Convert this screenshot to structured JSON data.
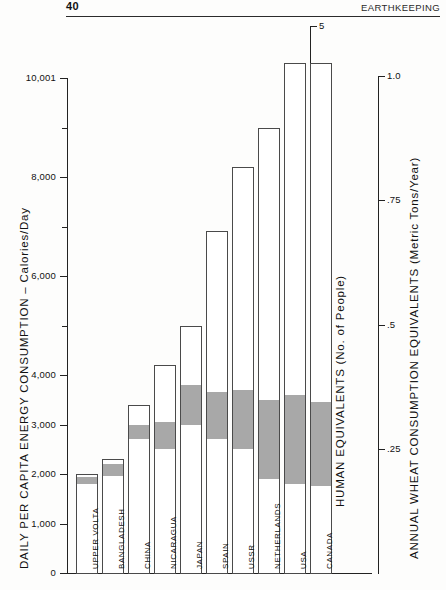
{
  "page": {
    "folio": "40",
    "running_head": "EARTHKEEPING"
  },
  "chart_data": {
    "type": "bar",
    "title": "",
    "categories": [
      "UPPER VOLTA",
      "BANGLADESH",
      "CHINA",
      "NICARAGUA",
      "JAPAN",
      "SPAIN",
      "USSR",
      "NETHERLANDS",
      "USA",
      "CANADA"
    ],
    "values": [
      2000,
      2300,
      3400,
      4200,
      5000,
      6900,
      8200,
      9000,
      10300,
      10300
    ],
    "series": [
      {
        "name": "Daily per capita energy consumption",
        "values": [
          2000,
          2300,
          3400,
          4200,
          5000,
          6900,
          8200,
          9000,
          10300,
          10300
        ]
      },
      {
        "name": "Shaded band (highlighted range)",
        "band_low": [
          1800,
          1950,
          2700,
          2500,
          3000,
          2700,
          2500,
          1900,
          1800,
          1750
        ],
        "band_high": [
          1930,
          2200,
          3000,
          3050,
          3800,
          3650,
          3700,
          3500,
          3600,
          3450
        ]
      }
    ],
    "left_axis": {
      "label": "DAILY PER CAPITA  ENERGY  CONSUMPTION – Calories/Day",
      "ticks": [
        "10,001",
        "8,000",
        "6,000",
        "4,000",
        "3,000",
        "2,000",
        "1,000",
        "0"
      ],
      "tick_values": [
        10001,
        8000,
        6000,
        4000,
        3000,
        2000,
        1000,
        0
      ],
      "minor_ticks": [
        9000,
        7000,
        5000
      ],
      "ylim": [
        0,
        10001
      ]
    },
    "right_axis_inner": {
      "label": "HUMAN  EQUIVALENTS   (No. of People)",
      "ticks": [
        "5",
        "4",
        "3",
        "2",
        "1"
      ],
      "tick_values": [
        5,
        4,
        3,
        2,
        1
      ],
      "ylim": [
        0,
        5
      ]
    },
    "right_axis_outer": {
      "label": "ANNUAL  WHEAT CONSUMPTION  EQUIVALENTS  (Metric Tons/Year)",
      "ticks": [
        "1.0",
        ".75",
        ".5",
        ".25"
      ],
      "tick_values": [
        1.0,
        0.75,
        0.5,
        0.25
      ],
      "ylim": [
        0,
        1.0
      ]
    },
    "grid": false,
    "legend": "none",
    "colors": {
      "bar_fill": "#ffffff",
      "bar_stroke": "#4a4a4a",
      "band_fill": "#a8a8a8",
      "axis": "#222222"
    }
  }
}
